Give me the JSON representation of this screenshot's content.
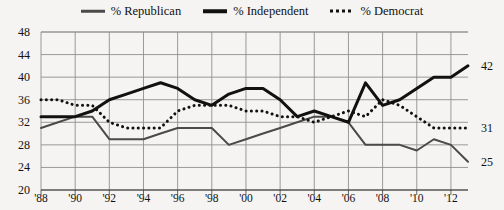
{
  "chart_data": {
    "type": "line",
    "title": "",
    "xlabel": "",
    "ylabel": "",
    "ylim": [
      20,
      48
    ],
    "xlim": [
      1988,
      2013
    ],
    "grid": true,
    "legend_position": "top-center",
    "y_ticks": [
      20,
      24,
      28,
      32,
      36,
      40,
      44,
      48
    ],
    "x_ticks": [
      1988,
      1990,
      1992,
      1994,
      1996,
      1998,
      2000,
      2002,
      2004,
      2006,
      2008,
      2010,
      2012
    ],
    "x_tick_labels": [
      "'88",
      "'90",
      "'92",
      "'94",
      "'96",
      "'98",
      "'00",
      "'02",
      "'04",
      "'06",
      "'08",
      "'10",
      "'12"
    ],
    "x": [
      1988,
      1989,
      1990,
      1991,
      1992,
      1993,
      1994,
      1995,
      1996,
      1997,
      1998,
      1999,
      2000,
      2001,
      2002,
      2003,
      2004,
      2005,
      2006,
      2007,
      2008,
      2009,
      2010,
      2011,
      2012,
      2013
    ],
    "series": [
      {
        "name": "% Republican",
        "style": "solid-gray",
        "color": "#4a4a4a",
        "end_label": "25",
        "values": [
          31,
          32,
          33,
          33,
          29,
          29,
          29,
          30,
          31,
          31,
          31,
          28,
          29,
          30,
          31,
          32,
          33,
          33,
          32,
          28,
          28,
          28,
          27,
          29,
          28,
          25
        ]
      },
      {
        "name": "% Independent",
        "style": "solid-black",
        "color": "#111111",
        "end_label": "42",
        "values": [
          33,
          33,
          33,
          34,
          36,
          37,
          38,
          39,
          38,
          36,
          35,
          37,
          38,
          38,
          36,
          33,
          34,
          33,
          32,
          39,
          35,
          36,
          38,
          40,
          40,
          42
        ]
      },
      {
        "name": "% Democrat",
        "style": "dotted",
        "color": "#111111",
        "end_label": "31",
        "values": [
          36,
          36,
          35,
          35,
          32,
          31,
          31,
          31,
          34,
          35,
          35,
          35,
          34,
          34,
          33,
          33,
          32,
          33,
          34,
          33,
          36,
          35,
          33,
          31,
          31,
          31
        ]
      }
    ]
  },
  "legend": {
    "items": [
      {
        "label": "% Republican",
        "swatch": "solid-gray-line-icon"
      },
      {
        "label": "% Independent",
        "swatch": "solid-black-line-icon"
      },
      {
        "label": "% Democrat",
        "swatch": "dotted-line-icon"
      }
    ]
  }
}
